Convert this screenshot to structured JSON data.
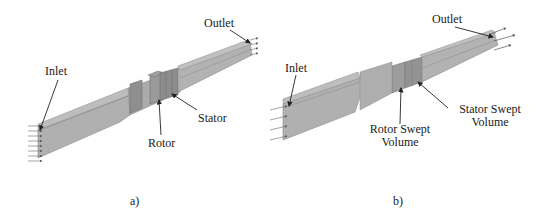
{
  "figure": {
    "panels": [
      {
        "id": "a",
        "caption": "a)",
        "labels": {
          "inlet": "Inlet",
          "outlet": "Outlet",
          "rotor": "Rotor",
          "stator": "Stator"
        }
      },
      {
        "id": "b",
        "caption": "b)",
        "labels": {
          "inlet": "Inlet",
          "outlet": "Outlet",
          "rotor_line1": "Rotor Swept",
          "rotor_line2": "Volume",
          "stator_line1": "Stator Swept",
          "stator_line2": "Volume"
        }
      }
    ],
    "colors": {
      "duct_top": "#b4b4b4",
      "duct_side": "#a6a6a6",
      "duct_edge": "#8a8a8a",
      "blade_region": "#999999",
      "arrow": "#222222"
    }
  }
}
